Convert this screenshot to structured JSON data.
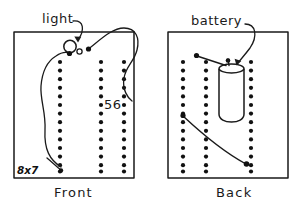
{
  "figure": {
    "type": "diagram",
    "style": "hand-drawn line sketch, black ink on white",
    "panels": [
      {
        "id": "front",
        "caption": "Front",
        "bounds": {
          "x": 14,
          "y": 32,
          "w": 120,
          "h": 146
        },
        "dot_columns": [
          {
            "x": 60,
            "count": 14,
            "y_start": 62,
            "y_step": 8.6
          },
          {
            "x": 101,
            "count": 14,
            "y_start": 62,
            "y_step": 8.6
          },
          {
            "x": 124,
            "count": 14,
            "y_start": 62,
            "y_step": 8.6
          }
        ],
        "annotations": [
          {
            "name": "light",
            "label": "light",
            "label_x": 42,
            "label_y": 20
          },
          {
            "name": "count-56",
            "label": "56",
            "label_x": 105,
            "label_y": 105
          },
          {
            "name": "dimensions",
            "label": "8x7",
            "label_x": 18,
            "label_y": 171
          }
        ],
        "objects": [
          {
            "name": "light-bulb",
            "shape": "circle",
            "cx": 70,
            "cy": 47,
            "r": 6
          },
          {
            "name": "light-bulb-base",
            "shape": "circle",
            "cx": 79,
            "cy": 52,
            "r": 2.4
          }
        ]
      },
      {
        "id": "back",
        "caption": "Back",
        "bounds": {
          "x": 168,
          "y": 32,
          "w": 120,
          "h": 146
        },
        "dot_columns": [
          {
            "x": 183,
            "count": 14,
            "y_start": 62,
            "y_step": 8.6
          },
          {
            "x": 206,
            "count": 14,
            "y_start": 62,
            "y_step": 8.6
          },
          {
            "x": 251,
            "count": 14,
            "y_start": 62,
            "y_step": 8.6
          }
        ],
        "annotations": [
          {
            "name": "battery",
            "label": "battery",
            "label_x": 191,
            "label_y": 22
          }
        ],
        "objects": [
          {
            "name": "battery-cylinder",
            "shape": "cylinder",
            "x": 219,
            "y": 66,
            "w": 25,
            "h": 52
          }
        ]
      }
    ],
    "colors": {
      "ink": "#1a1a1a",
      "background": "#ffffff",
      "dot": "#111111"
    },
    "labels": {
      "light": "light",
      "battery": "battery",
      "front": "Front",
      "back": "Back",
      "fiftysix": "56",
      "eight_by_seven": "8x7"
    }
  }
}
